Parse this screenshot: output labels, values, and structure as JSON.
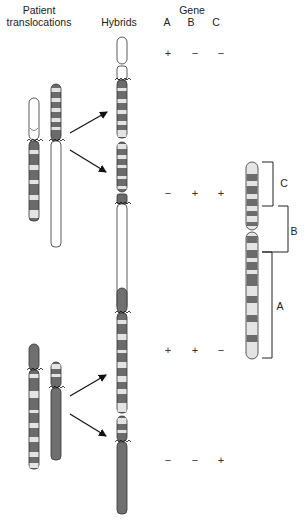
{
  "headers": {
    "patient_line1": "Patient",
    "patient_line2": "translocations",
    "hybrids": "Hybrids",
    "gene": "Gene",
    "gene_a": "A",
    "gene_b": "B",
    "gene_c": "C"
  },
  "hybrid_rows": [
    {
      "a": "+",
      "b": "−",
      "c": "−"
    },
    {
      "a": "−",
      "b": "+",
      "c": "+"
    },
    {
      "a": "+",
      "b": "+",
      "c": "−"
    },
    {
      "a": "−",
      "b": "−",
      "c": "+"
    }
  ],
  "reference_regions": {
    "c": "C",
    "b": "B",
    "a": "A"
  },
  "colors": {
    "dark_band": "#6b6b6b",
    "light_band": "#e4e4e4",
    "outline": "#333333",
    "dark_chromosome": "#707070"
  }
}
